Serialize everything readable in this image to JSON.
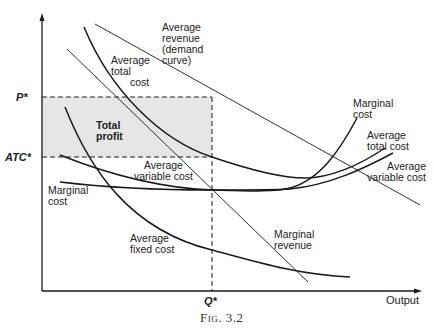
{
  "figure": {
    "caption": "Fig. 3.2",
    "x_axis_label": "Output",
    "y_ticks": {
      "price": "P*",
      "atc": "ATC*"
    },
    "x_ticks": {
      "quantity": "Q*"
    },
    "region_label": [
      "Total",
      "profit"
    ],
    "curve_labels": {
      "average_revenue": [
        "Average",
        "revenue",
        "(demand",
        "curve)"
      ],
      "atc_left": [
        "Average",
        "total",
        "cost"
      ],
      "avc_left": [
        "Average",
        "variable cost"
      ],
      "mc_left": [
        "Marginal",
        "cost"
      ],
      "afc": [
        "Average",
        "fixed cost"
      ],
      "mr": [
        "Marginal",
        "revenue"
      ],
      "mc_right": [
        "Marginal",
        "cost"
      ],
      "atc_right": [
        "Average",
        "total cost"
      ],
      "avc_right": [
        "Average",
        "variable cost"
      ]
    },
    "colors": {
      "line": "#1a1a1a",
      "shade": "#e6e6e6",
      "background": "#ffffff"
    }
  }
}
